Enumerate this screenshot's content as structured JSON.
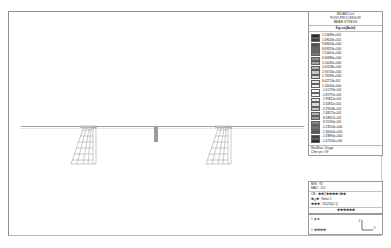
{
  "window": {
    "app": "fea-postprocessor",
    "background": "#ffffff"
  },
  "legend": {
    "header_lines": [
      "MIDAS/Civil",
      "POST-PROCESSOR",
      "BEAM STRESS"
    ],
    "component": "Sig-xx(Axial)",
    "swatches": [
      {
        "color": "#2b2b2b",
        "value": "1.21689e+001"
      },
      {
        "color": "#3e3e3e",
        "value": "1.09543e+001"
      },
      {
        "color": "#525252",
        "value": "9.83444e+000"
      },
      {
        "color": "#666666",
        "value": "8.69423e+000"
      },
      {
        "color": "#7a7a7a",
        "value": "7.55401e+000"
      },
      {
        "color": "#8f8f8f",
        "value": "6.30386e+000"
      },
      {
        "color": "#a3a3a3",
        "value": "5.14035e+000"
      },
      {
        "color": "#b5b5b5",
        "value": "4.05108e+000"
      },
      {
        "color": "#c6c6c6",
        "value": "2.94716e+000"
      },
      {
        "color": "#d6d6d6",
        "value": "1.79289e+000"
      },
      {
        "color": "#e4e4e4",
        "value": "8.42713e-001"
      },
      {
        "color": "#f1f1f1",
        "value": "1.20000e+000"
      },
      {
        "color": "#fafafa",
        "value": "-1.41759e-001"
      },
      {
        "color": "#f2f2f2",
        "value": "-2.81791e-001"
      },
      {
        "color": "#e6e6e6",
        "value": "-1.95812e-001"
      },
      {
        "color": "#d7d7d7",
        "value": "-3.32811e-001"
      },
      {
        "color": "#c4c4c4",
        "value": "-5.29208e-001"
      },
      {
        "color": "#b0b0b0",
        "value": "-7.48175e-001"
      },
      {
        "color": "#9b9b9b",
        "value": "-8.33857e-001"
      },
      {
        "color": "#868686",
        "value": "-9.70760e-001"
      },
      {
        "color": "#6f6f6f",
        "value": "-1.23554e+000"
      },
      {
        "color": "#585858",
        "value": "-1.30064e+000"
      },
      {
        "color": "#424242",
        "value": "-1.33890e+000"
      },
      {
        "color": "#2c2c2c",
        "value": "-1.47100e+000"
      }
    ],
    "footer": [
      "Min/Max: Usage",
      "Clmn pn: Off"
    ]
  },
  "info": {
    "lines": [
      "MIN : 92",
      "MAX : 110"
    ],
    "meta": [
      "CB : ��Ʈ���� 0��",
      "�ݷ� : Nzfor 2",
      "��� : 35(24)(0.1)"
    ],
    "caption": "������"
  },
  "triad": {
    "title": "���� ����",
    "axis_x": "X",
    "axis_y": "Y",
    "axis_z": "Z",
    "label_top": "1. �ܸ�",
    "label_bottom": "2. ����"
  },
  "model": {
    "name": "bridge-frame-model",
    "deck_label": "",
    "pier_label": "",
    "abutment_left": "abutment-left",
    "abutment_right": "abutment-right"
  }
}
